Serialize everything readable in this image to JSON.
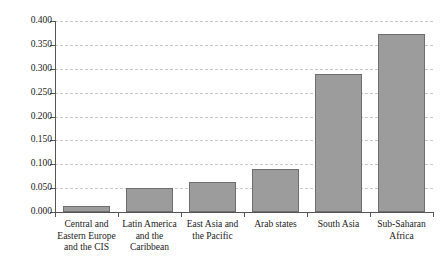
{
  "chart_data": {
    "type": "bar",
    "title": "",
    "subtitle": "",
    "xlabel": "",
    "ylabel": "",
    "ylim": [
      0.0,
      0.4
    ],
    "ytick_step": 0.05,
    "grid": true,
    "legend": null,
    "categories": [
      "Central and\nEastern Europe\nand the CIS",
      "Latin America\nand the\nCaribbean",
      "East Asia and\nthe Pacific",
      "Arab states",
      "South Asia",
      "Sub-Saharan\nAfrica"
    ],
    "values": [
      0.012,
      0.05,
      0.062,
      0.09,
      0.29,
      0.372
    ],
    "ytick_labels": [
      "0.000",
      "0.050",
      "0.100",
      "0.150",
      "0.200",
      "0.250",
      "0.300",
      "0.350",
      "0.400"
    ],
    "ytick_values": [
      0.0,
      0.05,
      0.1,
      0.15,
      0.2,
      0.25,
      0.3,
      0.35,
      0.4
    ],
    "colors": {
      "bar_fill": "#9c9c9c",
      "bar_border": "#6e6e6e",
      "gridline": "#c9c9c9",
      "axis": "#555555",
      "text": "#1a1a1a",
      "background": "#ffffff"
    }
  }
}
